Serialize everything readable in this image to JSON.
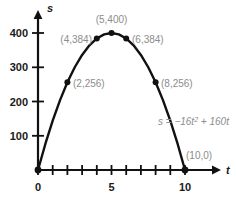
{
  "chart_data": {
    "type": "line",
    "title": "",
    "subtitle": "",
    "xlabel": "t",
    "ylabel": "s",
    "equation": "s = −16t² + 160t",
    "equation_parts": {
      "lhs": "s = −16",
      "var1": "t",
      "exponent": "2",
      "rhs": " + 160",
      "var2": "t"
    },
    "grid": false,
    "legend": "none",
    "xlim": [
      0,
      11.2
    ],
    "ylim": [
      0,
      440
    ],
    "x": [
      0,
      0.5,
      1,
      1.5,
      2,
      2.5,
      3,
      3.5,
      4,
      4.5,
      5,
      5.5,
      6,
      6.5,
      7,
      7.5,
      8,
      8.5,
      9,
      9.5,
      10
    ],
    "y": [
      0,
      76,
      144,
      204,
      256,
      300,
      336,
      364,
      384,
      396,
      400,
      396,
      384,
      364,
      336,
      300,
      256,
      204,
      144,
      76,
      0
    ],
    "xticks": [
      0,
      1,
      2,
      3,
      4,
      5,
      6,
      7,
      8,
      9,
      10
    ],
    "xtick_labels": [
      {
        "value": 0,
        "label": "0"
      },
      {
        "value": 5,
        "label": "5"
      },
      {
        "value": 10,
        "label": "10"
      }
    ],
    "yticks": [
      100,
      200,
      300,
      400
    ],
    "ytick_labels": [
      "100",
      "200",
      "300",
      "400"
    ],
    "markers": [
      {
        "x": 0,
        "y": 0,
        "label": "",
        "label_dx": 0,
        "label_dy": 0,
        "anchor": "start"
      },
      {
        "x": 2,
        "y": 256,
        "label": "(2,256)",
        "label_dx": 6,
        "label_dy": 5,
        "anchor": "start"
      },
      {
        "x": 4,
        "y": 384,
        "label": "(4,384)",
        "label_dx": -6,
        "label_dy": 5,
        "anchor": "end"
      },
      {
        "x": 5,
        "y": 400,
        "label": "(5,400)",
        "label_dx": 0,
        "label_dy": -9,
        "anchor": "middle"
      },
      {
        "x": 6,
        "y": 384,
        "label": "(6,384)",
        "label_dx": 6,
        "label_dy": 5,
        "anchor": "start"
      },
      {
        "x": 8,
        "y": 256,
        "label": "(8,256)",
        "label_dx": 6,
        "label_dy": 5,
        "anchor": "start"
      },
      {
        "x": 10,
        "y": 0,
        "label": "(10,0)",
        "label_dx": -2,
        "label_dy": -11,
        "anchor": "start"
      }
    ],
    "colors": {
      "curve": "#111111",
      "axis": "#111111",
      "marker": "#111111",
      "tick_text": "#1a1a1a",
      "label_text": "#8c8c8c",
      "background": "#ffffff"
    }
  }
}
